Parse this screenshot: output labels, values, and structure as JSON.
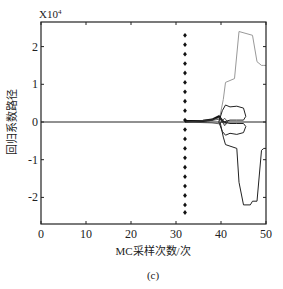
{
  "figure": {
    "caption": "(c)",
    "scale_label": "X10",
    "scale_exp": "4"
  },
  "chart_data": {
    "type": "line",
    "title": "",
    "xlabel": "MC采样次数/次",
    "ylabel": "回归系数路径",
    "y_scale_note": "×10^4",
    "xlim": [
      0,
      50
    ],
    "ylim": [
      -2.6,
      2.6
    ],
    "xticks": [
      0,
      10,
      20,
      30,
      40,
      50
    ],
    "xtick_labels": [
      "0",
      "10",
      "20",
      "30",
      "40",
      "50"
    ],
    "yticks": [
      2,
      1,
      0,
      -1,
      -2
    ],
    "ytick_labels": [
      "2",
      "1",
      "0",
      "-1",
      "-2"
    ],
    "grid": false,
    "legend": null,
    "series": [
      {
        "name": "baseline",
        "style": "solid",
        "color": "#222222",
        "x": [
          0,
          32,
          37,
          40,
          50
        ],
        "y": [
          0,
          0,
          0,
          0,
          0
        ]
      },
      {
        "name": "upper-gray-path",
        "style": "solid",
        "color": "#999999",
        "x": [
          39.5,
          40.5,
          41,
          43,
          44,
          47,
          48,
          49,
          49.5,
          50
        ],
        "y": [
          0,
          0.6,
          1.05,
          1.15,
          2.4,
          2.3,
          1.6,
          1.5,
          1.5,
          1.5
        ]
      },
      {
        "name": "lower-black-path",
        "style": "solid",
        "color": "#222222",
        "x": [
          39.8,
          40.5,
          41,
          43.5,
          44,
          45,
          46.5,
          47,
          48,
          49,
          49.5,
          50
        ],
        "y": [
          0,
          -0.4,
          -0.6,
          -0.7,
          -1.6,
          -2.2,
          -2.2,
          -2.1,
          -2.1,
          -0.75,
          -0.7,
          -0.7
        ]
      },
      {
        "name": "upper-inner-path",
        "style": "solid",
        "color": "#222222",
        "x": [
          39.5,
          40.3,
          41,
          42,
          43.5,
          45,
          45.5,
          45,
          43.5,
          42,
          40.5
        ],
        "y": [
          0,
          0.3,
          0.45,
          0.4,
          0.42,
          0.37,
          0.15,
          0.05,
          0.05,
          0.05,
          0
        ]
      },
      {
        "name": "lower-inner-path",
        "style": "solid",
        "color": "#222222",
        "x": [
          39.5,
          40.3,
          41,
          42,
          43.5,
          45,
          45.5,
          45,
          43.5,
          42,
          40.5
        ],
        "y": [
          0,
          -0.25,
          -0.35,
          -0.3,
          -0.33,
          -0.28,
          -0.12,
          -0.04,
          -0.04,
          -0.04,
          0
        ]
      },
      {
        "name": "converging-bundle",
        "style": "solid",
        "color": "#111111",
        "x": [
          32,
          36,
          38,
          39.5,
          40.5
        ],
        "y": [
          0.02,
          0.03,
          0.06,
          0.15,
          0.0
        ]
      }
    ],
    "markers": {
      "name": "dotted-vertical-markers",
      "symbol": "diamond",
      "x": 32,
      "y": [
        2.3,
        2.05,
        1.8,
        1.55,
        1.3,
        1.05,
        0.8,
        0.55,
        0.3,
        0.05,
        -0.2,
        -0.45,
        -0.7,
        -0.95,
        -1.2,
        -1.45,
        -1.7,
        -1.95,
        -2.2,
        -2.4
      ]
    }
  }
}
